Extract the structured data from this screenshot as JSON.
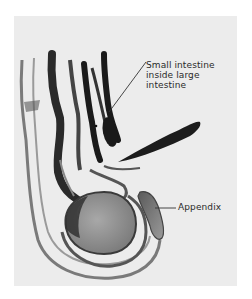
{
  "figure": {
    "labels": {
      "small_intestine": {
        "lines": [
          "Small intestine",
          "inside large",
          "intestine"
        ]
      },
      "appendix": "Appendix"
    },
    "colors": {
      "background": "#ffffff",
      "paper": "#ececec",
      "ink_dark": "#1a1a1a",
      "ink_mid": "#6a6a6a",
      "ink_light": "#b4b4b4"
    }
  }
}
